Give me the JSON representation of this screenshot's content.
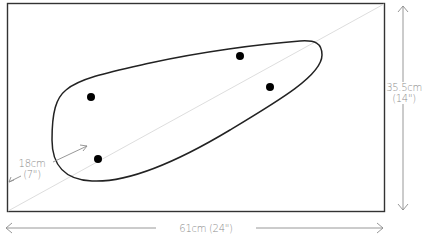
{
  "diagram": {
    "type": "dimension drawing",
    "board": {
      "shape": "rectangle",
      "width": "61cm (24\")",
      "height": "35.5cm (14\")"
    },
    "shape": {
      "type": "teardrop/organic outline",
      "dots": 4
    },
    "dimensions": {
      "width_label": "61cm (24\")",
      "height_label_line1": "35.5cm",
      "height_label_line2": "(14\")",
      "diagonal_label_line1": "18cm",
      "diagonal_label_line2": "(7\")"
    },
    "colors": {
      "outline": "#333333",
      "dimension_lines": "#8c8c8c",
      "diagonal": "#d9d9d9",
      "dots": "#000000"
    }
  }
}
